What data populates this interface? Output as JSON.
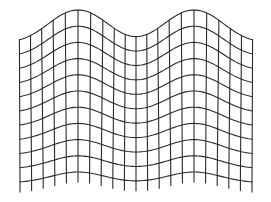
{
  "figure": {
    "title": "",
    "line_color": "#2a2a2a",
    "background": "#ffffff"
  },
  "grid": {
    "x_start": 20,
    "x_end": 252,
    "columns": 21,
    "y_top": 43,
    "y_bottom": 183,
    "rows": 11,
    "vertical_line_extend_bottom": 10,
    "bumps": [
      {
        "center_x": 78,
        "sigma": 38,
        "top_amplitude": 33,
        "bottom_amplitude": 11
      },
      {
        "center_x": 194,
        "sigma": 38,
        "top_amplitude": 33,
        "bottom_amplitude": 11
      }
    ],
    "horizontal_shear": 4
  }
}
